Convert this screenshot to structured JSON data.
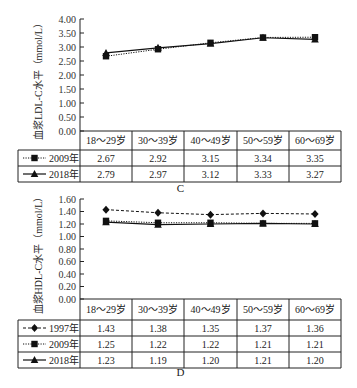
{
  "chart_data": [
    {
      "panel_label": "C",
      "type": "line",
      "title": "",
      "xlabel": "",
      "ylabel": "血浆LDL-C水平（mmol/L）",
      "categories": [
        "18～29岁",
        "30～39岁",
        "40～49岁",
        "50～59岁",
        "60～69岁"
      ],
      "ylim": [
        0,
        4.0
      ],
      "yticks": [
        "0.00",
        "0.50",
        "1.00",
        "1.50",
        "2.00",
        "2.50",
        "3.00",
        "3.50",
        "4.00"
      ],
      "grid": false,
      "legend": "table-left",
      "series": [
        {
          "name": "2009年",
          "marker": "square",
          "line": "dotted",
          "values": [
            2.67,
            2.92,
            3.15,
            3.34,
            3.35
          ]
        },
        {
          "name": "2018年",
          "marker": "triangle",
          "line": "solid",
          "values": [
            2.79,
            2.97,
            3.12,
            3.33,
            3.27
          ]
        }
      ],
      "table": [
        [
          "2.67",
          "2.92",
          "3.15",
          "3.34",
          "3.35"
        ],
        [
          "2.79",
          "2.97",
          "3.12",
          "3.33",
          "3.27"
        ]
      ]
    },
    {
      "panel_label": "D",
      "type": "line",
      "title": "",
      "xlabel": "",
      "ylabel": "血浆HDL-C水平（mmol/L）",
      "categories": [
        "18～29岁",
        "30～39岁",
        "40～49岁",
        "50～59岁",
        "60～69岁"
      ],
      "ylim": [
        0,
        1.6
      ],
      "yticks": [
        "0.00",
        "0.20",
        "0.40",
        "0.60",
        "0.80",
        "1.00",
        "1.20",
        "1.40",
        "1.60"
      ],
      "grid": false,
      "legend": "table-left",
      "series": [
        {
          "name": "1997年",
          "marker": "diamond",
          "line": "dashed",
          "values": [
            1.43,
            1.38,
            1.35,
            1.37,
            1.36
          ]
        },
        {
          "name": "2009年",
          "marker": "square",
          "line": "dotted",
          "values": [
            1.25,
            1.22,
            1.22,
            1.21,
            1.21
          ]
        },
        {
          "name": "2018年",
          "marker": "triangle",
          "line": "solid",
          "values": [
            1.23,
            1.19,
            1.2,
            1.21,
            1.2
          ]
        }
      ],
      "table": [
        [
          "1.43",
          "1.38",
          "1.35",
          "1.37",
          "1.36"
        ],
        [
          "1.25",
          "1.22",
          "1.22",
          "1.21",
          "1.21"
        ],
        [
          "1.23",
          "1.19",
          "1.20",
          "1.21",
          "1.20"
        ]
      ]
    }
  ]
}
